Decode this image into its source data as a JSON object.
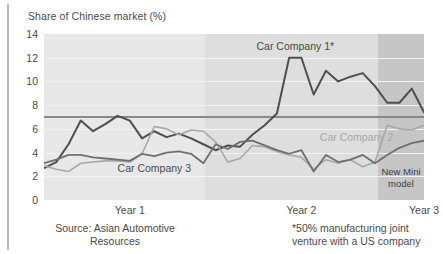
{
  "title": "Share of Chinese market (%)",
  "source_note": "Source: Asian Automotive\nResources",
  "source_note_line1": "Source: Asian Automotive",
  "source_note_line2": "Resources",
  "footnote_line1": "*50% manufacturing joint",
  "footnote_line2": "venture with a US company",
  "annotation_box": {
    "line1": "New Mini",
    "line2": "model"
  },
  "colors": {
    "series1": "#4f4f4f",
    "series2": "#a8a8a8",
    "series3": "#6f6f6f",
    "reference_line": "#8a8a8a",
    "band_year1": "#e8e8e8",
    "band_year2": "#dedede",
    "band_year3": "#c6c6c6",
    "text": "#4a4a4a"
  },
  "chart_data": {
    "type": "line",
    "title": "Share of Chinese market (%)",
    "xlabel": "",
    "ylabel": "Share of Chinese market (%)",
    "ylim": [
      0,
      14
    ],
    "yticks": [
      0,
      2,
      4,
      6,
      8,
      10,
      12,
      14
    ],
    "ytick_labels": [
      "0",
      "2",
      "4",
      "6",
      "8",
      "10",
      "12",
      "14"
    ],
    "grid": true,
    "legend": "inline-labels",
    "xticks": [
      7,
      21,
      31
    ],
    "xtick_labels": [
      "Year 1",
      "Year 2",
      "Year 3"
    ],
    "x_period_bands": [
      {
        "label": "Year 1",
        "start": 0,
        "end": 13.5,
        "color": "#e8e8e8"
      },
      {
        "label": "Year 2",
        "start": 13.5,
        "end": 28.0,
        "color": "#dedede"
      },
      {
        "label": "Year 3",
        "start": 28.0,
        "end": 31.9,
        "color": "#c6c6c6"
      }
    ],
    "reference_line": {
      "y": 7,
      "color": "#8a8a8a"
    },
    "annotations": [
      {
        "text": "Car Company 1*",
        "x": 20.5,
        "y": 12.9
      },
      {
        "text": "Car Company 2",
        "x": 25.5,
        "y": 5.2
      },
      {
        "text": "Car Company 3",
        "x": 9.0,
        "y": 2.6
      },
      {
        "text": "New Mini model",
        "x": 30.0,
        "y": 1.2
      }
    ],
    "x": [
      0,
      1,
      2,
      3,
      4,
      5,
      6,
      7,
      8,
      9,
      10,
      11,
      12,
      13,
      14,
      15,
      16,
      17,
      18,
      19,
      20,
      21,
      22,
      23,
      24,
      25,
      26,
      27,
      28,
      29,
      30,
      31
    ],
    "series": [
      {
        "name": "Car Company 1*",
        "color": "#4f4f4f",
        "values": [
          2.7,
          3.2,
          4.7,
          6.7,
          5.8,
          6.4,
          7.1,
          6.7,
          5.2,
          5.8,
          5.3,
          5.6,
          5.2,
          4.7,
          4.2,
          4.6,
          4.5,
          5.5,
          6.3,
          7.3,
          12.0,
          12.0,
          8.9,
          10.9,
          10.0,
          10.4,
          10.7,
          9.6,
          8.2,
          8.2,
          9.4,
          7.4
        ]
      },
      {
        "name": "Car Company 2",
        "color": "#a8a8a8",
        "values": [
          2.9,
          2.6,
          2.4,
          3.1,
          3.2,
          3.3,
          3.3,
          3.2,
          3.9,
          6.2,
          6.0,
          5.5,
          5.9,
          5.8,
          4.9,
          3.2,
          3.5,
          4.6,
          4.5,
          4.1,
          3.8,
          3.6,
          2.6,
          3.4,
          3.1,
          3.4,
          2.8,
          3.2,
          6.3,
          6.0,
          5.9,
          6.3
        ]
      },
      {
        "name": "Car Company 3",
        "color": "#6f6f6f",
        "values": [
          3.1,
          3.4,
          3.8,
          3.8,
          3.6,
          3.5,
          3.4,
          3.3,
          3.9,
          3.7,
          4.0,
          4.1,
          3.9,
          3.1,
          4.7,
          4.3,
          4.9,
          5.0,
          4.6,
          4.2,
          3.9,
          4.2,
          2.4,
          3.8,
          3.2,
          3.4,
          3.8,
          3.1,
          3.8,
          4.4,
          4.8,
          5.0
        ]
      }
    ]
  }
}
